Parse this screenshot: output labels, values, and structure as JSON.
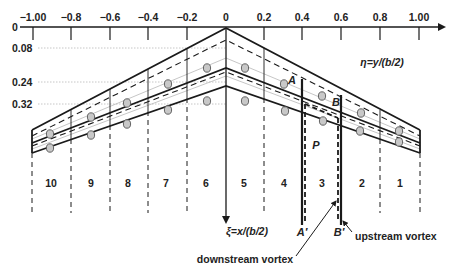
{
  "colors": {
    "line": "#1a1a1a",
    "grid": "#b8b8b8",
    "dot_fill": "#c8c8c8",
    "dot_stroke": "#555555",
    "text": "#222222"
  },
  "eta_axis": {
    "label": "η=y/(b/2)",
    "ticks": [
      {
        "label": "−1.00",
        "x": 33
      },
      {
        "label": "−0.8",
        "x": 71
      },
      {
        "label": "−0.6",
        "x": 110
      },
      {
        "label": "−0.4",
        "x": 148
      },
      {
        "label": "−0.2",
        "x": 187
      },
      {
        "label": "0",
        "x": 226
      },
      {
        "label": "0.2",
        "x": 264
      },
      {
        "label": "0.4",
        "x": 302
      },
      {
        "label": "0.6",
        "x": 341
      },
      {
        "label": "0.8",
        "x": 380
      },
      {
        "label": "1.00",
        "x": 419
      }
    ]
  },
  "xi_axis": {
    "label": "ξ=x/(b/2)",
    "ticks": [
      {
        "label": "0",
        "y": 27
      },
      {
        "label": "0.08",
        "y": 48
      },
      {
        "label": "0.24",
        "y": 82
      },
      {
        "label": "0.32",
        "y": 104
      }
    ]
  },
  "strips": [
    "10",
    "9",
    "8",
    "7",
    "6",
    "5",
    "4",
    "3",
    "2",
    "1"
  ],
  "point_labels": {
    "A": "A",
    "B": "B",
    "P": "P",
    "A_prime": "A′",
    "B_prime": "B′"
  },
  "annotations": {
    "downstream": "downstream vortex",
    "upstream": "upstream vortex"
  }
}
